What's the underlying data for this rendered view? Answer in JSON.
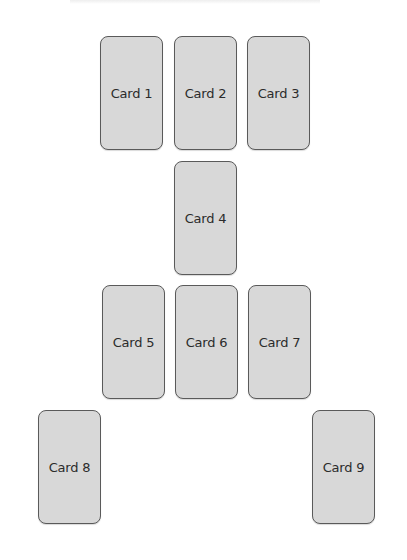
{
  "layout": {
    "cards": [
      {
        "label": "Card 1",
        "x": 100,
        "y": 36
      },
      {
        "label": "Card 2",
        "x": 174,
        "y": 36
      },
      {
        "label": "Card 3",
        "x": 247,
        "y": 36
      },
      {
        "label": "Card 4",
        "x": 174,
        "y": 161
      },
      {
        "label": "Card 5",
        "x": 102,
        "y": 285
      },
      {
        "label": "Card 6",
        "x": 175,
        "y": 285
      },
      {
        "label": "Card 7",
        "x": 248,
        "y": 285
      },
      {
        "label": "Card 8",
        "x": 38,
        "y": 410
      },
      {
        "label": "Card 9",
        "x": 312,
        "y": 410
      }
    ]
  },
  "colors": {
    "card_fill": "#d8d8d8",
    "card_border": "#5a5a5a",
    "text": "#2b2b2b"
  }
}
